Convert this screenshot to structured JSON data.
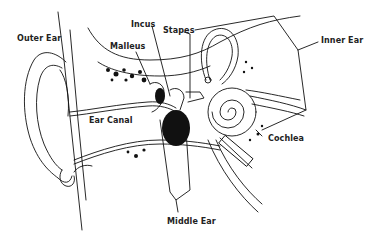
{
  "diagram": {
    "type": "anatomical-illustration",
    "subject": "ear",
    "colors": {
      "ink": "#111111",
      "background": "#ffffff"
    },
    "labels": {
      "outer_ear": "Outer Ear",
      "incus": "Incus",
      "stapes": "Stapes",
      "inner_ear": "Inner Ear",
      "malleus": "Malleus",
      "ear_canal": "Ear Canal",
      "cochlea": "Cochlea",
      "middle_ear": "Middle Ear"
    }
  }
}
